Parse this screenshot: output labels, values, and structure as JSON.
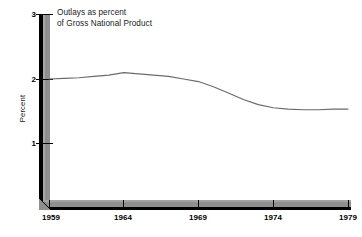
{
  "chart_data": {
    "type": "line",
    "title": "Outlays as percent of Gross National Product",
    "title_lines": [
      "Outlays as percent",
      "of Gross National Product"
    ],
    "xlabel": "",
    "ylabel": "Percent",
    "xlim": [
      1959,
      1979
    ],
    "ylim": [
      0,
      3
    ],
    "grid": false,
    "legend": false,
    "x_ticks": [
      "1959",
      "1964",
      "1969",
      "1974",
      "1979"
    ],
    "y_ticks": [
      "1",
      "2",
      "3"
    ],
    "series": [
      {
        "name": "Outlays as percent of GNP",
        "color": "#6b6b6b",
        "x": [
          1959,
          1960,
          1961,
          1962,
          1963,
          1964,
          1965,
          1966,
          1967,
          1968,
          1969,
          1970,
          1971,
          1972,
          1973,
          1974,
          1975,
          1976,
          1977,
          1978,
          1979
        ],
        "values": [
          2.0,
          2.01,
          2.02,
          2.04,
          2.06,
          2.1,
          2.08,
          2.06,
          2.04,
          2.0,
          1.96,
          1.88,
          1.78,
          1.68,
          1.6,
          1.55,
          1.53,
          1.52,
          1.52,
          1.53,
          1.53
        ]
      }
    ]
  },
  "axis": {
    "y_ticks": [
      {
        "label": "3",
        "value": 3
      },
      {
        "label": "2",
        "value": 2
      },
      {
        "label": "1",
        "value": 1
      }
    ],
    "x_ticks": [
      {
        "label": "1959",
        "value": 1959
      },
      {
        "label": "1964",
        "value": 1964
      },
      {
        "label": "1969",
        "value": 1969
      },
      {
        "label": "1974",
        "value": 1974
      },
      {
        "label": "1979",
        "value": 1979
      }
    ]
  },
  "colors": {
    "line": "#6b6b6b",
    "axis_face": "#8f8f8f",
    "axis_edge": "#000000",
    "text": "#1a1a1a",
    "background": "#ffffff"
  }
}
